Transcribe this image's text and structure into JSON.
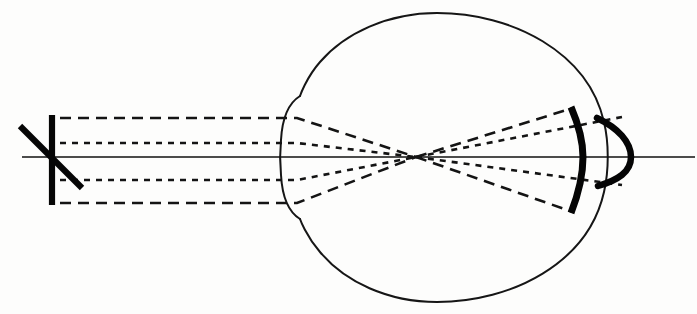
{
  "figure": {
    "title": "Schematic eye ray diagram",
    "caption": "",
    "background_color": "#fdfdfc",
    "ink_color": "#111111",
    "width": 697,
    "height": 314
  },
  "chart_data": {
    "type": "diagram",
    "title": "Schematic eye ray diagram",
    "elements": [
      {
        "name": "optical-axis",
        "kind": "line",
        "x1": 22,
        "y1": 157,
        "x2": 695,
        "y2": 157,
        "style": "solid-thin"
      },
      {
        "name": "object-vertical-bar",
        "kind": "line",
        "x1": 52,
        "y1": 115,
        "x2": 52,
        "y2": 205,
        "style": "bold"
      },
      {
        "name": "object-diagonal-bar",
        "kind": "line",
        "x1": 20,
        "y1": 126,
        "x2": 82,
        "y2": 188,
        "style": "bold"
      },
      {
        "name": "eye-globe-outline",
        "kind": "closed-curve",
        "center_x": 452,
        "center_y": 157,
        "radius_x": 157,
        "radius_y": 148,
        "style": "solid-outline"
      },
      {
        "name": "cornea-bulge",
        "kind": "arc",
        "x": 295,
        "y_top": 95,
        "y_bottom": 219,
        "style": "solid-outline"
      },
      {
        "name": "nodal-point",
        "kind": "point",
        "x": 416,
        "y": 157
      },
      {
        "name": "retina-image-arc",
        "kind": "arc",
        "x_apex": 578,
        "y_top": 107,
        "y_bottom": 213,
        "style": "bold"
      },
      {
        "name": "posterior-image-arc",
        "kind": "arc",
        "x_apex": 631,
        "y_top": 117,
        "y_bottom": 187,
        "style": "bold"
      }
    ],
    "rays": [
      {
        "name": "marginal-ray-upper",
        "dash": "long",
        "points": [
          [
            60,
            118
          ],
          [
            297,
            118
          ],
          [
            416,
            157
          ],
          [
            573,
            108
          ]
        ]
      },
      {
        "name": "marginal-ray-lower",
        "dash": "long",
        "points": [
          [
            60,
            203
          ],
          [
            297,
            203
          ],
          [
            416,
            157
          ],
          [
            573,
            212
          ]
        ]
      },
      {
        "name": "chief-ray-upper",
        "dash": "short",
        "points": [
          [
            60,
            143
          ],
          [
            297,
            143
          ],
          [
            416,
            157
          ],
          [
            622,
            117
          ]
        ]
      },
      {
        "name": "chief-ray-lower",
        "dash": "short",
        "points": [
          [
            60,
            180
          ],
          [
            297,
            180
          ],
          [
            416,
            157
          ],
          [
            622,
            185
          ]
        ]
      }
    ],
    "axis_ranges": {
      "x": [
        0,
        697
      ],
      "y": [
        0,
        314
      ]
    },
    "grid": false,
    "legend": null,
    "colors": {
      "ink": "#111111",
      "background": "#fdfdfc"
    }
  },
  "labels": {
    "object": "",
    "retina": "",
    "axis": ""
  }
}
